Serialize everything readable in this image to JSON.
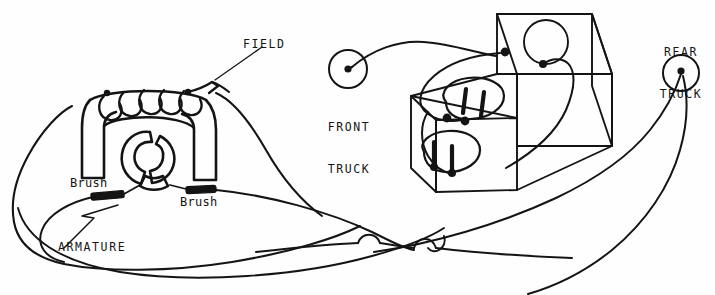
{
  "diagram": {
    "ink_color": "#141414",
    "background_color": "#fefefe",
    "labels": {
      "field": "FIELD",
      "front_truck_line1": "FRONT",
      "front_truck_line2": "TRUCK",
      "rear_truck_line1": "REAR",
      "rear_truck_line2": "TRUCK",
      "brush_left": "Brush",
      "brush_right": "Brush",
      "armature": "ARMATURE"
    },
    "components": {
      "field_coil": {
        "name": "field-coil",
        "turns": 5
      },
      "armature_rotor": {
        "name": "armature-rotor",
        "segments": 3
      },
      "brushes": {
        "name": "brush-contact",
        "count": 2
      },
      "controller_box": {
        "name": "controller-box",
        "terminal_posts": 4,
        "top_circle": 1
      },
      "front_truck_terminal": {
        "name": "front-truck-terminal"
      },
      "rear_truck_terminal": {
        "name": "rear-truck-terminal"
      },
      "wire_crossovers": 3
    }
  }
}
